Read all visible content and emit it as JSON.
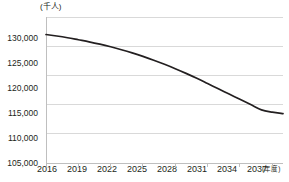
{
  "chart_data": {
    "type": "line",
    "title": "",
    "subtitle": "",
    "xlabel": "(年度)",
    "ylabel": "(千人)",
    "unit_top_label": "(千人)",
    "unit_right_label": "(年度)",
    "grid": true,
    "legend": "none",
    "xlim": [
      2016,
      2038
    ],
    "ylim": [
      105000,
      130000
    ],
    "y_ticks": [
      105000,
      110000,
      115000,
      120000,
      125000,
      130000
    ],
    "y_tick_labels": [
      "105,000",
      "110,000",
      "115,000",
      "120,000",
      "125,000",
      "130,000"
    ],
    "x_ticks": [
      2016,
      2019,
      2022,
      2025,
      2028,
      2031,
      2034,
      2037
    ],
    "x_tick_labels": [
      "2016",
      "2019",
      "2022",
      "2025",
      "2028",
      "2031",
      "2034",
      "2037"
    ],
    "series": [
      {
        "name": "総人口",
        "color": "#231f20",
        "x": [
          2016,
          2017,
          2018,
          2019,
          2020,
          2021,
          2022,
          2023,
          2024,
          2025,
          2026,
          2027,
          2028,
          2029,
          2030,
          2031,
          2032,
          2033,
          2034,
          2035,
          2036,
          2037,
          2038
        ],
        "values": [
          127000,
          126750,
          126450,
          126100,
          125750,
          125350,
          124900,
          124400,
          123850,
          123250,
          122600,
          121900,
          121150,
          120350,
          119500,
          118600,
          117700,
          116800,
          115900,
          115000,
          114100,
          113700,
          113450
        ]
      }
    ]
  },
  "axis_colors": {
    "gridline": "#d9d9d9",
    "axis_line": "#bfbfbf",
    "tick_mark": "#bfbfbf",
    "line_series": "#231f20",
    "text": "#231f20",
    "background": "#ffffff"
  }
}
